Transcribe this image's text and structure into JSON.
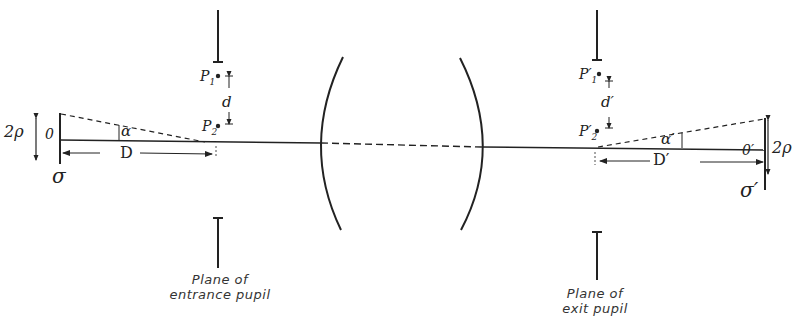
{
  "figure": {
    "type": "optical-diagram"
  },
  "labels": {
    "object_height": "2ρ",
    "object_point": "0",
    "object_plane": "σ",
    "angle_left": "α",
    "distance_left": "D",
    "point_p1": "P",
    "point_p1_sub": "1",
    "point_p2": "P",
    "point_p2_sub": "2",
    "separation_left": "d",
    "image_point": "0′",
    "image_height": "2ρ",
    "image_plane": "σ′",
    "angle_right": "α′",
    "distance_right": "D′",
    "point_p1_prime": "P′",
    "point_p1_prime_sub": "1",
    "point_p2_prime": "P′",
    "point_p2_prime_sub": "2",
    "separation_right": "d′"
  },
  "captions": {
    "entrance_line1": "Plane of",
    "entrance_line2": "entrance pupil",
    "exit_line1": "Plane of",
    "exit_line2": "exit pupil"
  },
  "colors": {
    "ink": "#222222",
    "background": "#ffffff"
  }
}
